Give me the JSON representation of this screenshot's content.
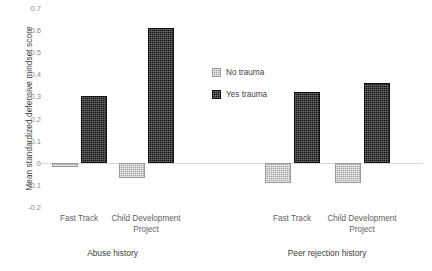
{
  "chart_data": {
    "type": "bar",
    "title": "",
    "xlabel": "",
    "ylabel": "Mean standardized defensive mindset score",
    "ylim": [
      -0.2,
      0.7
    ],
    "ytick_step": 0.1,
    "yticks": [
      "0.7",
      "0.6",
      "0.5",
      "0.4",
      "0.3",
      "0.2",
      "0.1",
      "0",
      "-0.1",
      "-0.2"
    ],
    "ytick_values": [
      0.7,
      0.6,
      0.5,
      0.4,
      0.3,
      0.2,
      0.1,
      0,
      -0.1,
      -0.2
    ],
    "grid": false,
    "legend_position": "center",
    "group_labels": [
      "Abuse history",
      "Peer rejection history"
    ],
    "categories": [
      "Fast Track",
      "Child Development Project",
      "Fast Track",
      "Child Development Project"
    ],
    "series": [
      {
        "name": "No trauma",
        "color": "#a6a6a6",
        "values": [
          -0.02,
          -0.07,
          -0.09,
          -0.09
        ]
      },
      {
        "name": "Yes trauma",
        "color": "#1a1a1a",
        "values": [
          0.3,
          0.61,
          0.32,
          0.36
        ]
      }
    ]
  },
  "legend": {
    "items": [
      {
        "label": "No trauma",
        "swatch": "no-trauma-swatch"
      },
      {
        "label": "Yes trauma",
        "swatch": "yes-trauma-swatch"
      }
    ]
  },
  "axis": {
    "y_title": "Mean standardized defensive mindset score"
  },
  "categories_display": [
    {
      "line1": "Fast Track",
      "line2": ""
    },
    {
      "line1": "Child Development",
      "line2": "Project"
    },
    {
      "line1": "Fast Track",
      "line2": ""
    },
    {
      "line1": "Child Development",
      "line2": "Project"
    }
  ],
  "groups": [
    {
      "label": "Abuse history"
    },
    {
      "label": "Peer rejection history"
    }
  ]
}
